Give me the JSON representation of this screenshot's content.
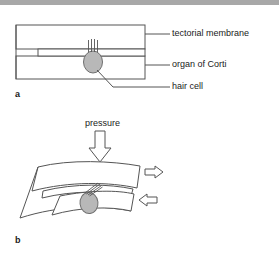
{
  "figure": {
    "width": 279,
    "height": 257,
    "background": "#ffffff",
    "band_color": "#a8a8a8",
    "stroke_color": "#4a4a4a",
    "cell_fill": "#b3b3b3",
    "cell_stroke": "#6b6b6b"
  },
  "panels": [
    {
      "letter": "a",
      "state": "resting",
      "description": "Straight, unbent tectorial membrane and organ of Corti with upright hair cell cilia"
    },
    {
      "letter": "b",
      "state": "deflected",
      "description": "Curved membranes under pressure with sheared hair cell cilia"
    }
  ],
  "labels": {
    "tectorial_membrane": "tectorial membrane",
    "organ_of_corti": "organ of Corti",
    "hair_cell": "hair cell",
    "pressure": "pressure"
  },
  "arrows": [
    {
      "name": "pressure-arrow",
      "direction": "down",
      "label": "pressure"
    },
    {
      "name": "shear-arrow-upper",
      "direction": "right",
      "label": ""
    },
    {
      "name": "shear-arrow-lower",
      "direction": "left",
      "label": ""
    }
  ]
}
